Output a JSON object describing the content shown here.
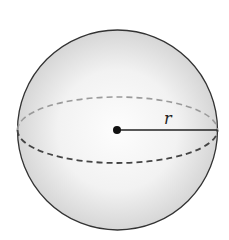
{
  "diagram": {
    "radius_label": "r",
    "colors": {
      "outline": "#333333",
      "back_dash": "#9a9a9a",
      "front_dash": "#444444",
      "fill_light": "#fbfbfb",
      "fill_shade": "#d4d4d4"
    }
  }
}
